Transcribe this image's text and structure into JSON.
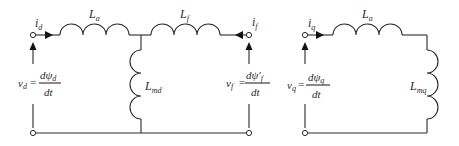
{
  "diagram": {
    "d_axis": {
      "current_left": {
        "main": "i",
        "sub": "d"
      },
      "series_inductor": {
        "main": "L",
        "sub": "a"
      },
      "field_inductor": {
        "main": "L",
        "sub": "f"
      },
      "current_right": {
        "main": "i",
        "sub": "f"
      },
      "magnetizing_inductor": {
        "main": "L",
        "sub": "md"
      },
      "voltage_left": {
        "lhs_main": "v",
        "lhs_sub": "d",
        "eq": "=",
        "num": "dψ",
        "num_sub": "d",
        "den": "dt"
      },
      "voltage_right": {
        "lhs_main": "v",
        "lhs_sub": "f",
        "eq": "=",
        "num": "dψ′",
        "num_sub": "f",
        "den": "dt"
      }
    },
    "q_axis": {
      "current": {
        "main": "i",
        "sub": "q"
      },
      "series_inductor": {
        "main": "L",
        "sub": "a"
      },
      "magnetizing_inductor": {
        "main": "L",
        "sub": "mq"
      },
      "voltage": {
        "lhs_main": "v",
        "lhs_sub": "q",
        "eq": "=",
        "num": "dψ",
        "num_sub": "q",
        "den": "dt"
      }
    }
  }
}
